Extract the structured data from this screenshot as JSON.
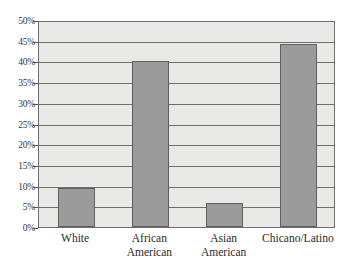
{
  "chart_data": {
    "type": "bar",
    "title": "",
    "xlabel": "",
    "ylabel": "",
    "categories": [
      "White",
      "African American",
      "Asian American",
      "Chicano/Latino"
    ],
    "category_lines": [
      [
        "White"
      ],
      [
        "African",
        "American"
      ],
      [
        "Asian",
        "American"
      ],
      [
        "Chicano/Latino"
      ]
    ],
    "values": [
      9.4,
      40.0,
      5.8,
      44.2
    ],
    "ylim": [
      0,
      50
    ],
    "ytick_step": 5,
    "ytick_labels": [
      "50%",
      "45%",
      "40%",
      "35%",
      "30%",
      "25%",
      "20%",
      "15%",
      "10%",
      "5%",
      "0%"
    ],
    "ytick_values": [
      50,
      45,
      40,
      35,
      30,
      25,
      20,
      15,
      10,
      5,
      0
    ],
    "grid": true,
    "legend": false,
    "legend_position": "none",
    "colors": {
      "bar_fill": "#9b9b9b",
      "bar_border": "#5f5f5f",
      "plot_background": "#e9e9e7",
      "gridline": "#6f6f6f",
      "axis": "#6d6d6d",
      "text": "#2b2b2b"
    }
  }
}
